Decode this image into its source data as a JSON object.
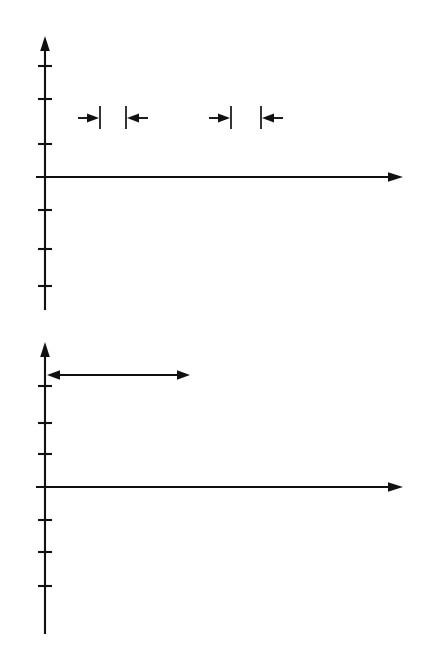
{
  "figure": {
    "type": "two-panel-waveform-diagram",
    "topic": "beats from superposition of two sine waves",
    "background": "#ffffff"
  },
  "panels": [
    {
      "id": "top",
      "y_axis_label": "y",
      "t_axis_label": "t",
      "measurements": [
        {
          "name": "period-first-wave",
          "label_plain": "T",
          "label_parts": {
            "lead": "",
            "fraction": "",
            "symbol": "T"
          }
        },
        {
          "name": "period-second-wave",
          "label_plain": "1⅙T",
          "label_parts": {
            "lead": "1",
            "fraction": "⅙",
            "symbol": "T"
          }
        }
      ]
    },
    {
      "id": "bottom",
      "y_axis_label": "y",
      "t_axis_label": "t",
      "measurements": [
        {
          "name": "beat-period",
          "label_plain": "Tʙ = 6T",
          "label_parts": {
            "symbol": "T",
            "subscript": "B",
            "equals": "=",
            "value": "6",
            "unit_symbol": "T"
          }
        }
      ]
    }
  ],
  "chart_data": {
    "type": "line",
    "title": "",
    "xlabel": "t",
    "ylabel": "y",
    "grid": false,
    "legend": "none",
    "colors": {
      "wave_a": "#2a2a2a",
      "wave_b": "#6d6d6d",
      "wave_faint": "#b9b9b9",
      "sum": "#0b0b0b",
      "envelope": "#b0b0b0",
      "axis": "#111111"
    },
    "x": {
      "min": 0,
      "max": 14,
      "unit": "T",
      "samples": 1700
    },
    "ylim": [
      -1.15,
      1.15
    ],
    "panels": [
      {
        "id": "top",
        "description": "two sine waves of slightly different period drawn overlapping",
        "series": [
          {
            "name": "wave-period-T",
            "style": "wave-a",
            "amplitude": 1.0,
            "period_in_T": 1.0,
            "frequency_cycles_per_T": 1.0,
            "phase_deg": 0
          },
          {
            "name": "wave-period-7over6-T",
            "style": "wave-b",
            "amplitude": 1.0,
            "period_in_T": 1.1667,
            "frequency_cycles_per_T": 0.857143,
            "phase_deg": 0
          }
        ],
        "annotations": [
          {
            "name": "period-T-span",
            "label": "T",
            "x_start_in_T": 1.5,
            "x_end_in_T": 2.5
          },
          {
            "name": "period-1-1over6-T-span",
            "label": "1⅙T",
            "x_start_in_T": 6.0,
            "x_end_in_T": 7.1667
          }
        ],
        "y_axis_ticks": 6
      },
      {
        "id": "bottom",
        "description": "superposition of the two waves showing beats with beat period 6T",
        "series": [
          {
            "name": "wave-period-T-faint",
            "style": "wave-faint",
            "amplitude": 0.5,
            "period_in_T": 1.0,
            "frequency_cycles_per_T": 1.0,
            "phase_deg": 0
          },
          {
            "name": "wave-period-7over6-T-faint",
            "style": "wave-faint",
            "amplitude": 0.5,
            "period_in_T": 1.1667,
            "frequency_cycles_per_T": 0.857143,
            "phase_deg": 0
          },
          {
            "name": "sum-wave",
            "style": "wave-sum",
            "amplitude": 1.0,
            "composition": "sum-of-two-faint-waves"
          },
          {
            "name": "envelope-upper",
            "style": "envelope",
            "amplitude": 1.0,
            "period_in_T": 6.0
          },
          {
            "name": "envelope-lower",
            "style": "envelope",
            "amplitude": -1.0,
            "period_in_T": 6.0
          }
        ],
        "annotations": [
          {
            "name": "beat-period-span",
            "label": "Tʙ = 6T",
            "x_start_in_T": 0.0,
            "x_end_in_T": 6.0
          }
        ],
        "y_axis_ticks": 6
      }
    ]
  }
}
